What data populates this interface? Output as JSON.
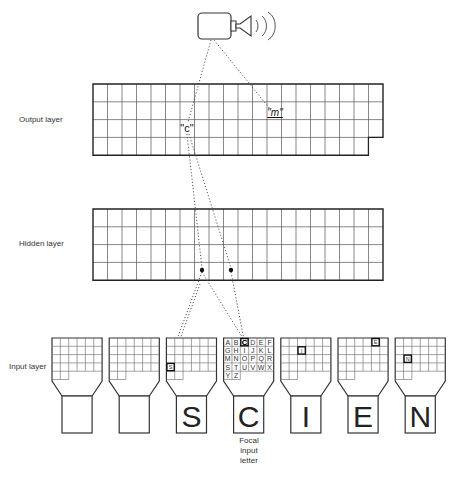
{
  "diagram": {
    "layers": {
      "output": {
        "label": "Output layer",
        "rows": 4,
        "cols": 20,
        "short_last_col_rows": 3
      },
      "hidden": {
        "label": "Hidden layer",
        "rows": 4,
        "cols": 20
      },
      "input": {
        "label": "Input layer"
      }
    },
    "output_labels": [
      {
        "id": "c",
        "text": "\"c\""
      },
      {
        "id": "m",
        "text": "\"m\""
      }
    ],
    "alphabet": [
      "A",
      "B",
      "C",
      "D",
      "E",
      "F",
      "G",
      "H",
      "I",
      "J",
      "K",
      "L",
      "M",
      "N",
      "O",
      "P",
      "Q",
      "R",
      "S",
      "T",
      "U",
      "V",
      "W",
      "X",
      "Y",
      "Z"
    ],
    "input_units": [
      {
        "letter": "",
        "active_index": null,
        "show_letters": false
      },
      {
        "letter": "",
        "active_index": null,
        "show_letters": false
      },
      {
        "letter": "S",
        "active_index": 18,
        "show_letters": false
      },
      {
        "letter": "C",
        "active_index": 2,
        "show_letters": true,
        "focal": true
      },
      {
        "letter": "I",
        "active_index": 8,
        "show_letters": false
      },
      {
        "letter": "E",
        "active_index": 4,
        "show_letters": false
      },
      {
        "letter": "N",
        "active_index": 13,
        "show_letters": false
      }
    ],
    "focal_caption": [
      "Focal",
      "input",
      "letter"
    ],
    "speaker": {
      "icon": "speaker-icon"
    },
    "colors": {
      "line": "#333333",
      "grid": "#555555",
      "dot": "#111111"
    }
  }
}
